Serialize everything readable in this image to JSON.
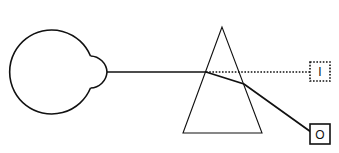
{
  "diagram": {
    "type": "optics-refraction-through-prism",
    "colors": {
      "stroke": "#111111",
      "background": "#ffffff"
    },
    "eye": {
      "label": "eye"
    },
    "prism": {
      "label": "prism"
    },
    "boxes": {
      "image": {
        "text": "I",
        "style": "dotted"
      },
      "object": {
        "text": "O",
        "style": "solid"
      }
    },
    "rays": {
      "apparent": {
        "style": "dotted"
      },
      "actual": {
        "style": "solid"
      }
    }
  }
}
